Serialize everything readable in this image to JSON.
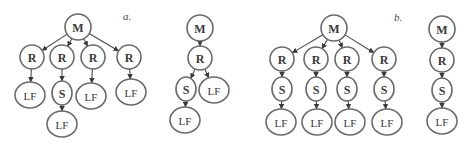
{
  "panels": [
    {
      "id": "a",
      "label": "a."
    },
    {
      "id": "b",
      "label": "b."
    }
  ],
  "node_types": {
    "M": "M",
    "R": "R",
    "S": "S",
    "LF": "LF"
  },
  "trees": [
    {
      "panel": "a",
      "name": "tree-a-wide",
      "edges": [
        [
          "M",
          "R1"
        ],
        [
          "M",
          "R2"
        ],
        [
          "M",
          "R3"
        ],
        [
          "M",
          "R4"
        ],
        [
          "R1",
          "LF1"
        ],
        [
          "R2",
          "S1"
        ],
        [
          "S1",
          "LF2"
        ],
        [
          "R3",
          "LF3"
        ],
        [
          "R4",
          "LF4"
        ]
      ],
      "nodes": {
        "M": "M",
        "R1": "R",
        "R2": "R",
        "R3": "R",
        "R4": "R",
        "S1": "S",
        "LF1": "LF",
        "LF2": "LF",
        "LF3": "LF",
        "LF4": "LF"
      }
    },
    {
      "panel": "a",
      "name": "tree-a-narrow",
      "edges": [
        [
          "M",
          "R1"
        ],
        [
          "R1",
          "S1"
        ],
        [
          "R1",
          "LF1"
        ],
        [
          "S1",
          "LF2"
        ]
      ],
      "nodes": {
        "M": "M",
        "R1": "R",
        "S1": "S",
        "LF1": "LF",
        "LF2": "LF"
      }
    },
    {
      "panel": "b",
      "name": "tree-b-wide",
      "edges": [
        [
          "M",
          "R1"
        ],
        [
          "M",
          "R2"
        ],
        [
          "M",
          "R3"
        ],
        [
          "M",
          "R4"
        ],
        [
          "R1",
          "S1"
        ],
        [
          "R2",
          "S2"
        ],
        [
          "R3",
          "S3"
        ],
        [
          "R4",
          "S4"
        ],
        [
          "S1",
          "LF1"
        ],
        [
          "S2",
          "LF2"
        ],
        [
          "S3",
          "LF3"
        ],
        [
          "S4",
          "LF4"
        ]
      ],
      "nodes": {
        "M": "M",
        "R1": "R",
        "R2": "R",
        "R3": "R",
        "R4": "R",
        "S1": "S",
        "S2": "S",
        "S3": "S",
        "S4": "S",
        "LF1": "LF",
        "LF2": "LF",
        "LF3": "LF",
        "LF4": "LF"
      }
    },
    {
      "panel": "b",
      "name": "tree-b-narrow",
      "edges": [
        [
          "M",
          "R1"
        ],
        [
          "R1",
          "S1"
        ],
        [
          "S1",
          "LF1"
        ]
      ],
      "nodes": {
        "M": "M",
        "R1": "R",
        "S1": "S",
        "LF1": "LF"
      }
    }
  ]
}
